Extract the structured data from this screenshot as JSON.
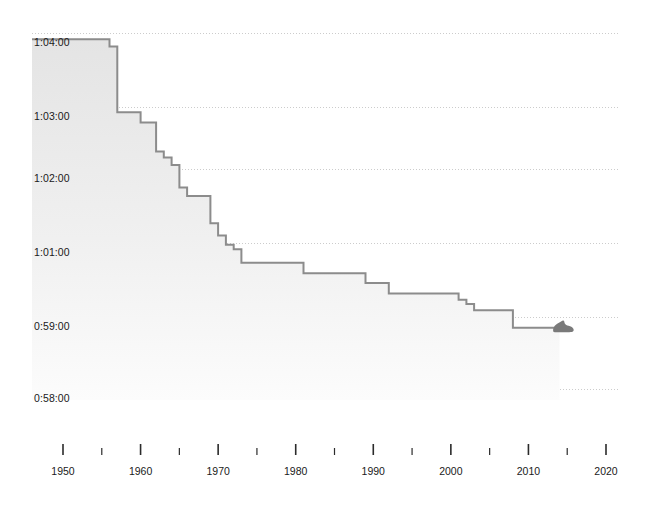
{
  "chart_data": {
    "type": "line",
    "title": "",
    "subtitle": "",
    "xlabel": "",
    "ylabel": "",
    "step_interpolation": "post",
    "grid": true,
    "legend": null,
    "xlim": [
      1948,
      2021
    ],
    "xtick_major": [
      1950,
      1960,
      1970,
      1980,
      1990,
      2000,
      2010,
      2020
    ],
    "xtick_minor": [
      1955,
      1965,
      1975,
      1985,
      1995,
      2005,
      2015
    ],
    "xtick_major_labels": [
      "1950",
      "1960",
      "1970",
      "1980",
      "1990",
      "2000",
      "2010",
      "2020"
    ],
    "ytick_labels": [
      "1:04:00",
      "1:03:00",
      "1:02:00",
      "1:01:00",
      "0:59:00",
      "0:58:00"
    ],
    "ytick_seconds": [
      3840,
      3780,
      3720,
      3660,
      3540,
      3480
    ],
    "ylim_seconds": [
      3470,
      3845
    ],
    "end_marker": {
      "icon": "running-shoe-icon",
      "year": 2014,
      "label": ""
    },
    "colors": {
      "line": "#8c8c8c",
      "fill_top": "#e6e6e6",
      "fill_bottom": "#fbfbfb",
      "grid": "#cccccc",
      "text": "#1a1a1a",
      "marker": "#7a7a7a"
    },
    "x": [
      1948,
      1956,
      1957,
      1960,
      1962,
      1963,
      1964,
      1965,
      1966,
      1969,
      1970,
      1971,
      1972,
      1973,
      1981,
      1989,
      1992,
      2001,
      2002,
      2003,
      2008,
      2014
    ],
    "values_seconds": [
      3835,
      3829,
      3775,
      3765,
      3737,
      3731,
      3724,
      3705,
      3698,
      3676,
      3666,
      3657,
      3650,
      3628,
      3611,
      3595,
      3578,
      3568,
      3561,
      3551,
      3531,
      3531
    ],
    "values_display": [
      "1:03:55",
      "1:03:49",
      "1:02:55",
      "1:02:45",
      "1:02:17",
      "1:02:11",
      "1:02:04",
      "1:01:45",
      "1:01:38",
      "1:01:16",
      "1:01:06",
      "1:00:57",
      "1:00:50",
      "1:00:28",
      "1:00:11",
      "0:59:55",
      "0:59:38",
      "0:59:28",
      "0:59:21",
      "0:59:11",
      "0:58:51",
      "0:58:51"
    ]
  }
}
